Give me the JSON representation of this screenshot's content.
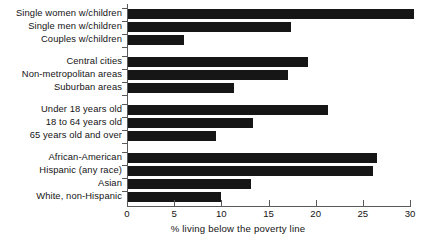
{
  "chart_data": {
    "type": "bar",
    "orientation": "horizontal",
    "title": "",
    "xlabel": "% living below the poverty line",
    "ylabel": "",
    "xlim": [
      0,
      30
    ],
    "xticks": [
      0,
      5,
      10,
      15,
      20,
      25,
      30
    ],
    "xtick_labels": [
      "0",
      "5",
      "10",
      "15",
      "20",
      "25",
      "30"
    ],
    "grid": false,
    "legend": null,
    "bar_color": "#161616",
    "axis_color": "#5a5a5a",
    "groups": [
      {
        "name": "family-type",
        "categories": [
          "Single women w/children",
          "Single men w/children",
          "Couples w/children"
        ],
        "values": [
          30.3,
          17.3,
          5.9
        ]
      },
      {
        "name": "residence",
        "categories": [
          "Central cities",
          "Non-metropolitan areas",
          "Suburban areas"
        ],
        "values": [
          19.1,
          17.0,
          11.2
        ]
      },
      {
        "name": "age",
        "categories": [
          "Under 18 years old",
          "18 to 64 years old",
          "65 years old and over"
        ],
        "values": [
          21.2,
          13.3,
          9.3
        ]
      },
      {
        "name": "race-ethnicity",
        "categories": [
          "African-American",
          "Hispanic (any race)",
          "Asian",
          "White, non-Hispanic"
        ],
        "values": [
          26.4,
          26.0,
          13.0,
          9.9
        ]
      }
    ],
    "categories": [
      "Single women w/children",
      "Single men w/children",
      "Couples w/children",
      "Central cities",
      "Non-metropolitan areas",
      "Suburban areas",
      "Under 18 years old",
      "18 to 64 years old",
      "65 years old and over",
      "African-American",
      "Hispanic (any race)",
      "Asian",
      "White, non-Hispanic"
    ],
    "values": [
      30.3,
      17.3,
      5.9,
      19.1,
      17.0,
      11.2,
      21.2,
      13.3,
      9.3,
      26.4,
      26.0,
      13.0,
      9.9
    ]
  }
}
